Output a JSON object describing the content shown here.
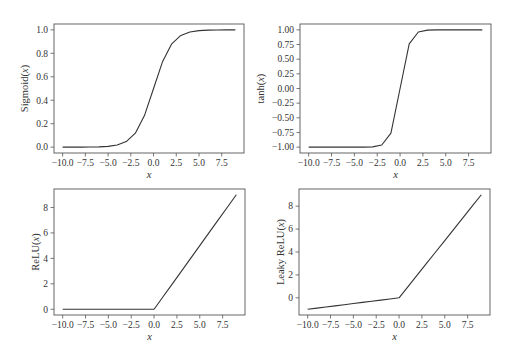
{
  "figure": {
    "layout": "2x2 grid",
    "background": "#ffffff",
    "line_color": "#333333"
  },
  "chart_data": [
    {
      "id": "sigmoid",
      "type": "line",
      "title": "",
      "xlabel": "x",
      "ylabel": "Sigmoid(x)",
      "x": [
        -10,
        -9,
        -8,
        -7,
        -6,
        -5,
        -4,
        -3,
        -2,
        -1,
        0,
        1,
        2,
        3,
        4,
        5,
        6,
        7,
        8,
        9
      ],
      "values": [
        0.0,
        0.0001,
        0.0003,
        0.0009,
        0.0025,
        0.0067,
        0.018,
        0.0474,
        0.1192,
        0.2689,
        0.5,
        0.7311,
        0.8808,
        0.9526,
        0.982,
        0.9933,
        0.9975,
        0.9991,
        0.9997,
        0.9999
      ],
      "xticks": [
        -10.0,
        -7.5,
        -5.0,
        -2.5,
        0.0,
        2.5,
        5.0,
        7.5
      ],
      "xtick_labels": [
        "−10.0",
        "−7.5",
        "−5.0",
        "−2.5",
        "0.0",
        "2.5",
        "5.0",
        "7.5"
      ],
      "yticks": [
        0.0,
        0.2,
        0.4,
        0.6,
        0.8,
        1.0
      ],
      "ytick_labels": [
        "0.0",
        "0.2",
        "0.4",
        "0.6",
        "0.8",
        "1.0"
      ],
      "xlim": [
        -10.95,
        9.95
      ],
      "ylim": [
        -0.05,
        1.05
      ],
      "grid": false,
      "legend": null,
      "frame_px": {
        "left": 54,
        "top": 24,
        "right": 244,
        "bottom": 153
      }
    },
    {
      "id": "tanh",
      "type": "line",
      "title": "",
      "xlabel": "x",
      "ylabel": "tanh(x)",
      "x": [
        -10,
        -9,
        -8,
        -7,
        -6,
        -5,
        -4,
        -3,
        -2,
        -1,
        0,
        1,
        2,
        3,
        4,
        5,
        6,
        7,
        8,
        9
      ],
      "values": [
        -1.0,
        -1.0,
        -1.0,
        -1.0,
        -1.0,
        -0.9999,
        -0.9993,
        -0.9951,
        -0.964,
        -0.7616,
        0.0,
        0.7616,
        0.964,
        0.9951,
        0.9993,
        0.9999,
        1.0,
        1.0,
        1.0,
        1.0
      ],
      "xticks": [
        -10.0,
        -7.5,
        -5.0,
        -2.5,
        0.0,
        2.5,
        5.0,
        7.5
      ],
      "xtick_labels": [
        "−10.0",
        "−7.5",
        "−5.0",
        "−2.5",
        "0.0",
        "2.5",
        "5.0",
        "7.5"
      ],
      "yticks": [
        -1.0,
        -0.75,
        -0.5,
        -0.25,
        0.0,
        0.25,
        0.5,
        0.75,
        1.0
      ],
      "ytick_labels": [
        "−1.00",
        "−0.75",
        "−0.50",
        "−0.25",
        "0.00",
        "0.25",
        "0.50",
        "0.75",
        "1.00"
      ],
      "xlim": [
        -10.95,
        9.95
      ],
      "ylim": [
        -1.1,
        1.1
      ],
      "grid": false,
      "legend": null,
      "frame_px": {
        "left": 300,
        "top": 24,
        "right": 491,
        "bottom": 153
      }
    },
    {
      "id": "relu",
      "type": "line",
      "title": "",
      "xlabel": "x",
      "ylabel": "ReLU(x)",
      "x": [
        -10,
        -9,
        -8,
        -7,
        -6,
        -5,
        -4,
        -3,
        -2,
        -1,
        0,
        1,
        2,
        3,
        4,
        5,
        6,
        7,
        8,
        9
      ],
      "values": [
        0,
        0,
        0,
        0,
        0,
        0,
        0,
        0,
        0,
        0,
        0,
        1,
        2,
        3,
        4,
        5,
        6,
        7,
        8,
        9
      ],
      "xticks": [
        -10.0,
        -7.5,
        -5.0,
        -2.5,
        0.0,
        2.5,
        5.0,
        7.5
      ],
      "xtick_labels": [
        "−10.0",
        "−7.5",
        "−5.0",
        "−2.5",
        "0.0",
        "2.5",
        "5.0",
        "7.5"
      ],
      "yticks": [
        0,
        2,
        4,
        6,
        8
      ],
      "ytick_labels": [
        "0",
        "2",
        "4",
        "6",
        "8"
      ],
      "xlim": [
        -10.95,
        9.95
      ],
      "ylim": [
        -0.45,
        9.45
      ],
      "grid": false,
      "legend": null,
      "frame_px": {
        "left": 54,
        "top": 189,
        "right": 245,
        "bottom": 315
      }
    },
    {
      "id": "leaky_relu",
      "type": "line",
      "title": "",
      "xlabel": "x",
      "ylabel": "Leaky ReLU(x)",
      "x": [
        -10,
        -9,
        -8,
        -7,
        -6,
        -5,
        -4,
        -3,
        -2,
        -1,
        0,
        1,
        2,
        3,
        4,
        5,
        6,
        7,
        8,
        9
      ],
      "values": [
        -1.0,
        -0.9,
        -0.8,
        -0.7,
        -0.6,
        -0.5,
        -0.4,
        -0.3,
        -0.2,
        -0.1,
        0,
        1,
        2,
        3,
        4,
        5,
        6,
        7,
        8,
        9
      ],
      "xticks": [
        -10.0,
        -7.5,
        -5.0,
        -2.5,
        0.0,
        2.5,
        5.0,
        7.5
      ],
      "xtick_labels": [
        "−10.0",
        "−7.5",
        "−5.0",
        "−2.5",
        "0.0",
        "2.5",
        "5.0",
        "7.5"
      ],
      "yticks": [
        0,
        2,
        4,
        6,
        8
      ],
      "ytick_labels": [
        "0",
        "2",
        "4",
        "6",
        "8"
      ],
      "xlim": [
        -10.95,
        9.95
      ],
      "ylim": [
        -1.5,
        9.5
      ],
      "grid": false,
      "legend": null,
      "frame_px": {
        "left": 299,
        "top": 189,
        "right": 490,
        "bottom": 315
      }
    }
  ]
}
